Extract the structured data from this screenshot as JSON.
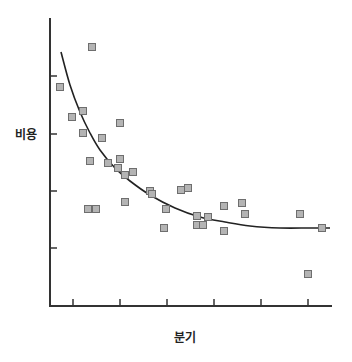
{
  "chart_data": {
    "type": "scatter",
    "title": "",
    "xlabel": "분기",
    "ylabel": "비용",
    "grid": false,
    "legend": null,
    "x_ticks": 6,
    "y_ticks": 4,
    "tick_labels_shown": false,
    "axis_ranges": {
      "x": [
        0,
        6
      ],
      "y": [
        0,
        5
      ]
    },
    "points_px": [
      [
        92,
        47
      ],
      [
        60,
        87
      ],
      [
        72,
        117
      ],
      [
        83,
        111
      ],
      [
        83,
        133
      ],
      [
        102,
        138
      ],
      [
        120,
        123
      ],
      [
        90,
        161
      ],
      [
        108,
        163
      ],
      [
        120,
        159
      ],
      [
        118,
        168
      ],
      [
        125,
        175
      ],
      [
        133,
        172
      ],
      [
        88,
        209
      ],
      [
        96,
        209
      ],
      [
        125,
        202
      ],
      [
        150,
        191
      ],
      [
        152,
        194
      ],
      [
        166,
        209
      ],
      [
        164,
        228
      ],
      [
        181,
        190
      ],
      [
        188,
        188
      ],
      [
        197,
        216
      ],
      [
        208,
        217
      ],
      [
        197,
        225
      ],
      [
        203,
        225
      ],
      [
        224,
        206
      ],
      [
        242,
        203
      ],
      [
        245,
        214
      ],
      [
        224,
        231
      ],
      [
        300,
        214
      ],
      [
        322,
        228
      ],
      [
        308,
        274
      ]
    ],
    "trend_curve_px": [
      [
        61,
        52
      ],
      [
        70,
        85
      ],
      [
        80,
        112
      ],
      [
        90,
        133
      ],
      [
        100,
        150
      ],
      [
        115,
        168
      ],
      [
        130,
        181
      ],
      [
        150,
        195
      ],
      [
        175,
        208
      ],
      [
        200,
        217
      ],
      [
        225,
        222
      ],
      [
        250,
        226
      ],
      [
        280,
        228
      ],
      [
        310,
        228
      ],
      [
        330,
        228
      ]
    ],
    "trend": "decreasing, exponential-decay fit",
    "marker": {
      "shape": "square",
      "fill": "#b4b4b4",
      "stroke": "#6e6e6e"
    },
    "colors": {
      "axis": "#333333",
      "curve": "#222222"
    }
  },
  "labels": {
    "x_axis": "분기",
    "y_axis": "비용"
  }
}
